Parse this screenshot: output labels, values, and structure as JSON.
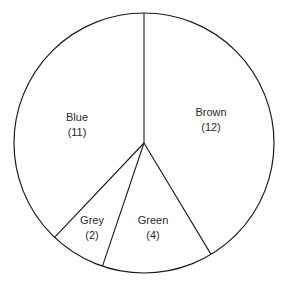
{
  "chart_data": {
    "type": "pie",
    "title": "",
    "start_angle_deg": 0,
    "direction": "clockwise",
    "categories": [
      "Brown",
      "Green",
      "Grey",
      "Blue"
    ],
    "values": [
      12,
      4,
      2,
      11
    ],
    "labels": [
      {
        "name": "Brown",
        "value_text": "(12)"
      },
      {
        "name": "Green",
        "value_text": "(4)"
      },
      {
        "name": "Grey",
        "value_text": "(2)"
      },
      {
        "name": "Blue",
        "value_text": "(11)"
      }
    ],
    "fill_color": "#ffffff",
    "stroke_color": "#1a1a1a",
    "legend": "none"
  }
}
